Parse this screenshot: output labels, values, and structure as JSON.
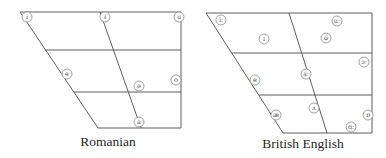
{
  "figure": {
    "type": "vowel-trapezoid-diagrams",
    "background_color": "#ffffff",
    "style": {
      "line_color": "#4d4d4d",
      "line_width": 0.9,
      "circle_stroke": "#8a8a8a",
      "circle_fill": "#ffffff",
      "circle_radius": 5,
      "symbol_color": "#4a4a4a",
      "caption_color": "#1f1f1f"
    },
    "charts": [
      {
        "id": "romanian",
        "caption": "Romanian",
        "caption_x": 108,
        "caption_y": 146,
        "segments": [
          {
            "name": "outline-top",
            "points": [
              20,
              12,
              181,
              12
            ]
          },
          {
            "name": "outline-right",
            "points": [
              181,
              12,
              181,
              128
            ]
          },
          {
            "name": "outline-bottom",
            "points": [
              98,
              128,
              181,
              128
            ]
          },
          {
            "name": "outline-left-diagonal",
            "points": [
              20,
              12,
              98,
              128
            ]
          },
          {
            "name": "close-mid-line",
            "points": [
              45,
              50,
              181,
              50
            ]
          },
          {
            "name": "open-mid-line",
            "points": [
              74,
              92,
              181,
              92
            ]
          },
          {
            "name": "central-diagonal",
            "points": [
              100,
              12,
              141,
              128
            ]
          }
        ],
        "vowels": [
          {
            "symbol": "i",
            "x": 27,
            "y": 17
          },
          {
            "symbol": "ɨ",
            "x": 105,
            "y": 17
          },
          {
            "symbol": "u",
            "x": 179,
            "y": 17
          },
          {
            "symbol": "e",
            "x": 67,
            "y": 74
          },
          {
            "symbol": "ə",
            "x": 139,
            "y": 86
          },
          {
            "symbol": "o",
            "x": 176,
            "y": 80
          },
          {
            "symbol": "a",
            "x": 139,
            "y": 122
          }
        ]
      },
      {
        "id": "british-english",
        "caption": "British English",
        "caption_x": 303,
        "caption_y": 148,
        "segments": [
          {
            "name": "outline-top",
            "points": [
              206,
              13,
              372,
              13
            ]
          },
          {
            "name": "outline-right",
            "points": [
              372,
              13,
              372,
              133
            ]
          },
          {
            "name": "outline-bottom",
            "points": [
              283,
              133,
              372,
              133
            ]
          },
          {
            "name": "outline-left-diagonal",
            "points": [
              206,
              13,
              283,
              133
            ]
          },
          {
            "name": "close-mid-line",
            "points": [
              232,
              53,
              372,
              53
            ]
          },
          {
            "name": "open-mid-line",
            "points": [
              259,
              95,
              372,
              95
            ]
          },
          {
            "name": "central-diagonal",
            "points": [
              289,
              13,
              327,
              133
            ]
          }
        ],
        "vowels": [
          {
            "symbol": "iː",
            "x": 221,
            "y": 20
          },
          {
            "symbol": "ɪ",
            "x": 264,
            "y": 39
          },
          {
            "symbol": "uː",
            "x": 337,
            "y": 21
          },
          {
            "symbol": "ʊ",
            "x": 326,
            "y": 38
          },
          {
            "symbol": "ɔː",
            "x": 364,
            "y": 62
          },
          {
            "symbol": "ɜː",
            "x": 306,
            "y": 74
          },
          {
            "symbol": "e",
            "x": 255,
            "y": 80
          },
          {
            "symbol": "ʌ",
            "x": 314,
            "y": 108
          },
          {
            "symbol": "æ",
            "x": 276,
            "y": 115
          },
          {
            "symbol": "ɒ",
            "x": 368,
            "y": 115
          },
          {
            "symbol": "ɑː",
            "x": 351,
            "y": 127
          }
        ]
      }
    ]
  }
}
